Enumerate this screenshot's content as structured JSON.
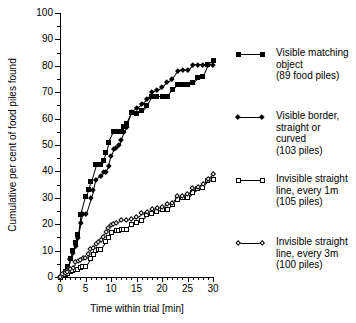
{
  "chart_data": {
    "type": "line",
    "title": "",
    "xlabel": "Time within trial [min]",
    "ylabel": "Cumulative per cent of food piles found",
    "xlim": [
      0,
      30
    ],
    "ylim": [
      0,
      100
    ],
    "xticks": [
      0,
      5,
      10,
      15,
      20,
      25,
      30
    ],
    "xtick_labels": [
      "0",
      "5",
      "10",
      "15",
      "20",
      "25",
      "30"
    ],
    "yticks": [
      0,
      10,
      20,
      30,
      40,
      50,
      60,
      70,
      80,
      90,
      100
    ],
    "ytick_labels": [
      "0",
      "10",
      "20",
      "30",
      "40",
      "50",
      "60",
      "70",
      "80",
      "90",
      "100"
    ],
    "grid": false,
    "legend_position": "right",
    "series": [
      {
        "name": "Visible matching object",
        "label_lines": [
          "Visible matching",
          "object",
          "(89 food piles)"
        ],
        "detail": "(89 food piles)",
        "marker": "filled-square",
        "color": "#000000",
        "x": [
          0,
          0.5,
          1,
          1.5,
          2,
          2.5,
          3,
          3.5,
          4,
          5,
          5.5,
          6,
          7,
          7.5,
          8,
          8.5,
          9,
          9.5,
          10.5,
          11,
          12,
          12.5,
          13,
          14,
          15,
          16,
          17,
          18,
          19,
          20,
          21,
          22,
          23,
          24,
          25,
          26,
          27,
          28,
          29,
          30
        ],
        "y": [
          0,
          1,
          2,
          4,
          7,
          10,
          13,
          16,
          23.5,
          30.5,
          33,
          36,
          42.5,
          42.5,
          42.5,
          44,
          47,
          51,
          55,
          55,
          55,
          57,
          58,
          62.5,
          62,
          63,
          65,
          68.5,
          68.5,
          68.5,
          68.5,
          71,
          73,
          73,
          73,
          73.5,
          75.5,
          76,
          80.5,
          82
        ]
      },
      {
        "name": "Visible border, straight or curved",
        "label_lines": [
          "Visible border,",
          "straight or",
          "curved",
          "(103 piles)"
        ],
        "detail": "(103 piles)",
        "marker": "filled-diamond",
        "color": "#000000",
        "x": [
          0,
          0.5,
          1,
          1.5,
          2,
          2.5,
          3,
          3.5,
          4,
          4.5,
          5,
          6,
          6.5,
          7,
          8,
          8.5,
          9,
          9.5,
          10,
          10.5,
          11,
          11.5,
          12,
          12.5,
          13,
          14,
          15,
          16,
          17,
          18,
          19,
          20,
          21,
          22,
          23,
          24,
          25,
          26,
          27,
          28,
          29,
          30
        ],
        "y": [
          0,
          1,
          2,
          3.5,
          7,
          9,
          12,
          15,
          20.5,
          24,
          24,
          30,
          33,
          37,
          38.5,
          40,
          40,
          42,
          46,
          48.5,
          49,
          50,
          52,
          55,
          57,
          62.5,
          64,
          65.5,
          67.5,
          70,
          71,
          72,
          74,
          75,
          78,
          78.5,
          78.5,
          80.5,
          80.5,
          80.5,
          80.5,
          80.5
        ]
      },
      {
        "name": "Invisible straight line, every 1m",
        "label_lines": [
          "Invisible straight",
          "line, every 1m",
          "(105 piles)"
        ],
        "detail": "(105 piles)",
        "marker": "open-square",
        "color": "#000000",
        "x": [
          0,
          0.5,
          1,
          1.5,
          2,
          2.5,
          3,
          3.5,
          4,
          4.5,
          5,
          6,
          6.5,
          7,
          7.5,
          8,
          9,
          9.5,
          10,
          11,
          11.5,
          12,
          12.5,
          13,
          14,
          15,
          16,
          17,
          18,
          19,
          20,
          21,
          22,
          23,
          24,
          25,
          26,
          27,
          28,
          29,
          30
        ],
        "y": [
          0,
          0.5,
          1,
          1.5,
          2,
          2.5,
          3,
          3,
          3.5,
          4,
          4,
          7,
          8.5,
          10,
          10.5,
          10.5,
          13.5,
          15,
          17,
          17.5,
          17.5,
          18,
          18,
          18,
          20,
          20.5,
          21.5,
          23.5,
          24,
          25,
          25.5,
          25.5,
          27.5,
          29.5,
          30,
          30,
          32,
          33.5,
          34,
          36.5,
          37
        ]
      },
      {
        "name": "Invisible straight line, every 3m",
        "label_lines": [
          "Invisible straight",
          "line, every 3m",
          "(100 piles)"
        ],
        "detail": "(100 piles)",
        "marker": "open-diamond",
        "color": "#000000",
        "x": [
          0,
          0.5,
          1,
          1.5,
          2,
          2.5,
          3,
          3.5,
          4,
          4.5,
          5,
          5.5,
          6,
          6.5,
          7,
          7.5,
          8,
          8.5,
          9,
          9.5,
          10,
          10.5,
          11,
          12,
          13,
          14,
          15,
          16,
          17,
          18,
          19,
          20,
          21,
          22,
          23,
          24,
          25,
          26,
          27,
          28,
          29,
          30
        ],
        "y": [
          0,
          1,
          1.5,
          2,
          3,
          3.5,
          5.5,
          6,
          6.5,
          7,
          7,
          8.5,
          10.5,
          11,
          12.5,
          13,
          14,
          15,
          17,
          18.5,
          19.5,
          20,
          20.5,
          21.5,
          21.5,
          22,
          22.5,
          24,
          24.5,
          25.5,
          26,
          26.5,
          27.5,
          28,
          30.5,
          30.5,
          31.5,
          33.5,
          34,
          35,
          37,
          39
        ]
      }
    ]
  }
}
